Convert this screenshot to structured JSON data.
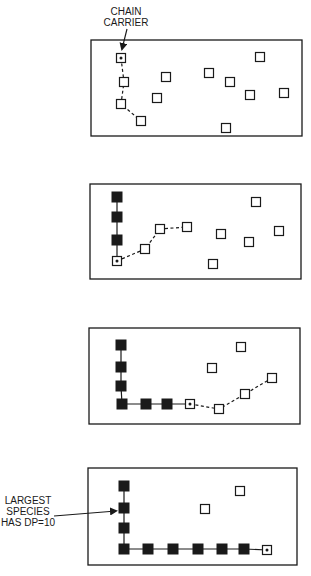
{
  "diagram": {
    "colors": {
      "ink": "#1a1a1a",
      "background": "#ffffff"
    },
    "annotations": {
      "chain_carrier": [
        "CHAIN",
        "CARRIER"
      ],
      "largest_species": [
        "LARGEST",
        "SPECIES",
        "HAS DP=10"
      ]
    },
    "panels": [
      {
        "id": "panel-1",
        "box": [
          91,
          40,
          302,
          136
        ],
        "carrier": [
          121,
          58
        ],
        "filled": [],
        "open": [
          [
            124,
            82
          ],
          [
            121,
            104
          ],
          [
            141,
            121
          ],
          [
            166,
            77
          ],
          [
            157,
            98
          ],
          [
            260,
            57
          ],
          [
            209,
            73
          ],
          [
            230,
            82
          ],
          [
            250,
            95
          ],
          [
            284,
            93
          ],
          [
            226,
            128
          ]
        ],
        "dashed_path": [
          [
            121,
            58
          ],
          [
            124,
            82
          ],
          [
            121,
            104
          ],
          [
            141,
            121
          ]
        ],
        "solid_path": []
      },
      {
        "id": "panel-2",
        "box": [
          90,
          184,
          301,
          279
        ],
        "carrier": [
          117,
          261
        ],
        "filled": [
          [
            117,
            197
          ],
          [
            117,
            217
          ],
          [
            117,
            240
          ]
        ],
        "open": [
          [
            145,
            249
          ],
          [
            160,
            229
          ],
          [
            187,
            227
          ],
          [
            256,
            202
          ],
          [
            221,
            234
          ],
          [
            249,
            242
          ],
          [
            279,
            231
          ],
          [
            213,
            264
          ]
        ],
        "dashed_path": [
          [
            117,
            261
          ],
          [
            145,
            249
          ],
          [
            160,
            229
          ],
          [
            187,
            227
          ]
        ],
        "solid_path": [
          [
            117,
            197
          ],
          [
            117,
            217
          ],
          [
            117,
            240
          ],
          [
            117,
            261
          ]
        ]
      },
      {
        "id": "panel-3",
        "box": [
          89,
          328,
          300,
          424
        ],
        "carrier": [
          190,
          404
        ],
        "filled": [
          [
            121,
            345
          ],
          [
            121,
            367
          ],
          [
            121,
            386
          ],
          [
            122,
            404
          ],
          [
            146,
            404
          ],
          [
            167,
            404
          ]
        ],
        "open": [
          [
            241,
            347
          ],
          [
            212,
            368
          ],
          [
            219,
            409
          ],
          [
            245,
            394
          ],
          [
            272,
            378
          ]
        ],
        "dashed_path": [
          [
            190,
            404
          ],
          [
            219,
            409
          ],
          [
            245,
            394
          ],
          [
            272,
            378
          ]
        ],
        "solid_path": [
          [
            121,
            345
          ],
          [
            121,
            367
          ],
          [
            121,
            386
          ],
          [
            122,
            404
          ],
          [
            146,
            404
          ],
          [
            167,
            404
          ],
          [
            190,
            404
          ]
        ]
      },
      {
        "id": "panel-4",
        "box": [
          88,
          468,
          297,
          565
        ],
        "carrier": [
          267,
          550
        ],
        "filled": [
          [
            124,
            486
          ],
          [
            124,
            508
          ],
          [
            124,
            528
          ],
          [
            124,
            549
          ],
          [
            148,
            549
          ],
          [
            173,
            549
          ],
          [
            198,
            549
          ],
          [
            222,
            549
          ],
          [
            244,
            549
          ]
        ],
        "open": [
          [
            240,
            491
          ],
          [
            205,
            509
          ]
        ],
        "dashed_path": [],
        "solid_path": [
          [
            124,
            486
          ],
          [
            124,
            508
          ],
          [
            124,
            528
          ],
          [
            124,
            549
          ],
          [
            148,
            549
          ],
          [
            173,
            549
          ],
          [
            198,
            549
          ],
          [
            222,
            549
          ],
          [
            244,
            549
          ],
          [
            267,
            550
          ]
        ]
      }
    ]
  }
}
